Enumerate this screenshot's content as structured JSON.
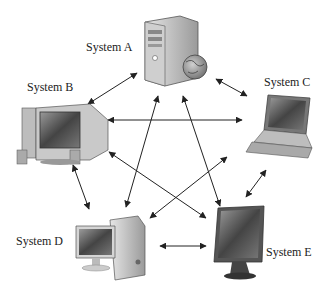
{
  "diagram": {
    "type": "network",
    "colors": {
      "background": "#ffffff",
      "arrow": "#222222",
      "text": "#222222",
      "device_dark": "#555555",
      "device_light": "#d9d9d9"
    },
    "nodes": [
      {
        "id": "A",
        "label": "System A",
        "device": "server-tower-with-globe",
        "x": 168,
        "y": 48
      },
      {
        "id": "B",
        "label": "System B",
        "device": "desktop-crt",
        "x": 55,
        "y": 140
      },
      {
        "id": "C",
        "label": "System C",
        "device": "laptop",
        "x": 280,
        "y": 130
      },
      {
        "id": "D",
        "label": "System D",
        "device": "desktop-lcd",
        "x": 115,
        "y": 255
      },
      {
        "id": "E",
        "label": "System E",
        "device": "lcd-monitor",
        "x": 238,
        "y": 250
      }
    ],
    "edges": [
      {
        "from": "A",
        "to": "B",
        "bidirectional": true
      },
      {
        "from": "A",
        "to": "C",
        "bidirectional": true
      },
      {
        "from": "A",
        "to": "D",
        "bidirectional": true
      },
      {
        "from": "A",
        "to": "E",
        "bidirectional": true
      },
      {
        "from": "B",
        "to": "C",
        "bidirectional": true
      },
      {
        "from": "B",
        "to": "D",
        "bidirectional": true
      },
      {
        "from": "B",
        "to": "E",
        "bidirectional": true
      },
      {
        "from": "C",
        "to": "D",
        "bidirectional": true
      },
      {
        "from": "C",
        "to": "E",
        "bidirectional": true
      },
      {
        "from": "D",
        "to": "E",
        "bidirectional": true
      }
    ]
  },
  "labels": {
    "a": "System A",
    "b": "System B",
    "c": "System C",
    "d": "System D",
    "e": "System E"
  }
}
